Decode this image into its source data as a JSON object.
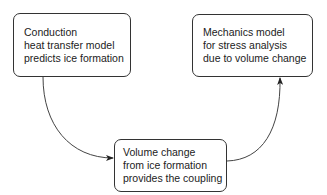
{
  "diagram": {
    "type": "flow",
    "nodes": [
      {
        "id": "conduction",
        "lines": [
          "Conduction",
          "heat transfer model",
          "predicts ice formation"
        ]
      },
      {
        "id": "mechanics",
        "lines": [
          "Mechanics model",
          "for stress analysis",
          "due to volume change"
        ]
      },
      {
        "id": "coupling",
        "lines": [
          "Volume change",
          "from ice formation",
          "provides the coupling"
        ]
      }
    ],
    "edges": [
      {
        "from": "conduction",
        "to": "coupling",
        "style": "curved-arrow"
      },
      {
        "from": "coupling",
        "to": "mechanics",
        "style": "curved-arrow"
      }
    ],
    "colors": {
      "stroke": "#333333",
      "text": "#222222",
      "background": "#ffffff"
    }
  }
}
